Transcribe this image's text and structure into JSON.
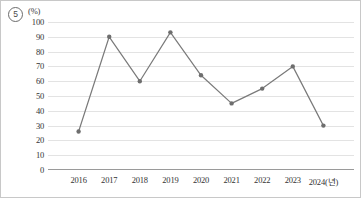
{
  "item_marker": {
    "label": "5",
    "glyph": "⑤"
  },
  "chart_data": {
    "type": "line",
    "title": "",
    "subtitle": "",
    "xlabel": "2024(년)",
    "ylabel": "(%)",
    "unit_label": "(%)",
    "x_axis_suffix": "(년)",
    "categories": [
      "2016",
      "2017",
      "2018",
      "2019",
      "2020",
      "2021",
      "2022",
      "2023",
      "2024"
    ],
    "xtick_labels": [
      "2016",
      "2017",
      "2018",
      "2019",
      "2020",
      "2021",
      "2022",
      "2023",
      "2024(년)"
    ],
    "values": [
      26,
      90,
      60,
      93,
      64,
      45,
      55,
      70,
      30
    ],
    "ylim": [
      0,
      100
    ],
    "ytick_labels": [
      "100",
      "90",
      "80",
      "70",
      "60",
      "50",
      "40",
      "30",
      "20",
      "10",
      "0"
    ],
    "ytick_values": [
      100,
      90,
      80,
      70,
      60,
      50,
      40,
      30,
      20,
      10,
      0
    ],
    "grid": true,
    "legend": "none",
    "line_color": "#7a7a7a",
    "marker_color": "#6e6e6e",
    "marker_shape": "circle",
    "gridline_color": "#e3e3e3",
    "axis_color": "#9a9a9a"
  }
}
